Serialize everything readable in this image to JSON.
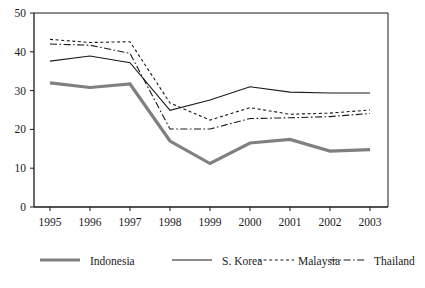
{
  "chart_data": {
    "type": "line",
    "title": "",
    "xlabel": "",
    "ylabel": "",
    "x": [
      1995,
      1996,
      1997,
      1998,
      1999,
      2000,
      2001,
      2002,
      2003
    ],
    "categories": [
      "1995",
      "1996",
      "1997",
      "1998",
      "1999",
      "2000",
      "2001",
      "2002",
      "2003"
    ],
    "ylim": [
      0,
      50
    ],
    "yticks": [
      0,
      10,
      20,
      30,
      40,
      50
    ],
    "ytick_labels": [
      "0",
      "10",
      "20",
      "30",
      "40",
      "50"
    ],
    "xlim": [
      1994.6,
      2003.45
    ],
    "grid": false,
    "legend_position": "bottom",
    "series": [
      {
        "name": "Indonesia",
        "style": "thick-solid-gray",
        "color": "#808080",
        "values": [
          32.0,
          30.8,
          31.7,
          17.0,
          11.2,
          16.5,
          17.4,
          14.4,
          14.8
        ]
      },
      {
        "name": "S. Korea",
        "style": "thin-solid-black",
        "color": "#1a1a1a",
        "values": [
          37.6,
          38.9,
          37.2,
          24.9,
          27.6,
          31.0,
          29.6,
          29.4,
          29.4
        ]
      },
      {
        "name": "Malaysia",
        "style": "dotted-black",
        "color": "#1a1a1a",
        "values": [
          43.2,
          42.4,
          42.6,
          26.8,
          22.4,
          25.6,
          23.9,
          24.2,
          25.0
        ]
      },
      {
        "name": "Thailand",
        "style": "dash-dot-black",
        "color": "#1a1a1a",
        "values": [
          42.0,
          41.7,
          39.6,
          20.1,
          20.1,
          22.8,
          23.0,
          23.3,
          24.1
        ]
      }
    ]
  },
  "legend": {
    "items": [
      {
        "label": "Indonesia",
        "swatch": "thick-solid-gray"
      },
      {
        "label": "S. Korea",
        "swatch": "thin-solid-black"
      },
      {
        "label": "Malaysia",
        "swatch": "dotted-black"
      },
      {
        "label": "Thailand",
        "swatch": "dash-dot-black"
      }
    ]
  }
}
